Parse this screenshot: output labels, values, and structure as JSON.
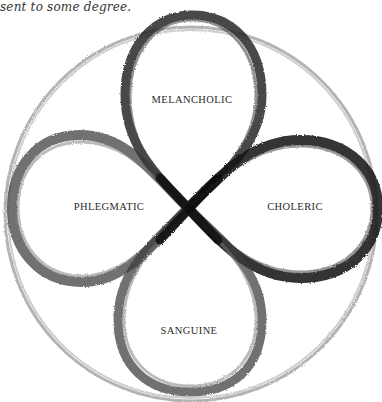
{
  "caption": "sent to some degree.",
  "diagram": {
    "labels": {
      "top": "MELANCHOLIC",
      "left": "PHLEGMATIC",
      "right": "CHOLERIC",
      "bottom": "SANGUINE"
    },
    "colors": {
      "stroke_dark": "#1e1e1e",
      "stroke_mid": "#555555",
      "stroke_light": "#9a9a9a"
    }
  }
}
